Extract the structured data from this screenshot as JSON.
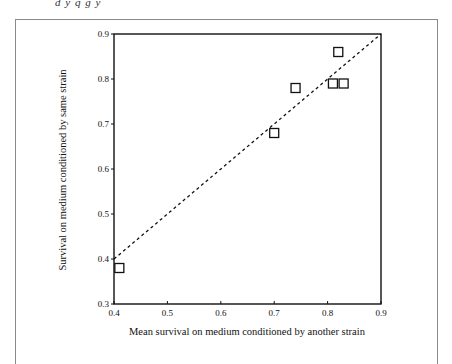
{
  "header_fragment": "d y q g y",
  "chart_data": {
    "type": "scatter",
    "title": "",
    "xlabel": "Mean survival on medium conditioned by another strain",
    "ylabel": "Survival on medium conditioned by same strain",
    "xlim": [
      0.4,
      0.9
    ],
    "ylim": [
      0.3,
      0.9
    ],
    "x_ticks": [
      "0.4",
      "0.5",
      "0.6",
      "0.7",
      "0.8",
      "0.9"
    ],
    "y_ticks": [
      "0.3",
      "0.4",
      "0.5",
      "0.6",
      "0.7",
      "0.8",
      "0.9"
    ],
    "grid": false,
    "legend": null,
    "marker": "open-square",
    "series": [
      {
        "name": "strains",
        "points": [
          {
            "x": 0.41,
            "y": 0.38
          },
          {
            "x": 0.7,
            "y": 0.68
          },
          {
            "x": 0.74,
            "y": 0.78
          },
          {
            "x": 0.81,
            "y": 0.79
          },
          {
            "x": 0.83,
            "y": 0.79
          },
          {
            "x": 0.82,
            "y": 0.86
          }
        ]
      }
    ],
    "reference_line": {
      "style": "dashed",
      "label": "y = x",
      "from": [
        0.4,
        0.4
      ],
      "to": [
        0.9,
        0.9
      ]
    }
  }
}
